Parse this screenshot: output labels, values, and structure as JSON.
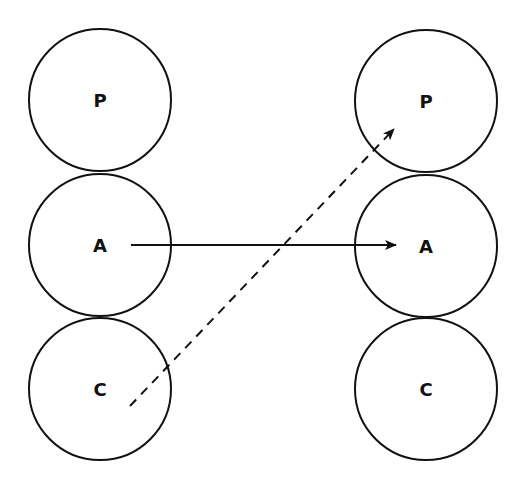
{
  "diagram": {
    "stroke_color": "#111111",
    "background": "#ffffff",
    "left_column": {
      "nodes": [
        {
          "label": "P",
          "cx": 100,
          "cy": 100,
          "r": 71
        },
        {
          "label": "A",
          "cx": 100,
          "cy": 245,
          "r": 71
        },
        {
          "label": "C",
          "cx": 100,
          "cy": 389,
          "r": 71
        }
      ]
    },
    "right_column": {
      "nodes": [
        {
          "label": "P",
          "cx": 426,
          "cy": 101,
          "r": 71
        },
        {
          "label": "A",
          "cx": 426,
          "cy": 246,
          "r": 71
        },
        {
          "label": "C",
          "cx": 426,
          "cy": 389,
          "r": 71
        }
      ]
    },
    "edges": [
      {
        "from": "left.A",
        "to": "right.A",
        "style": "solid",
        "x1": 131,
        "y1": 245,
        "x2": 396,
        "y2": 245
      },
      {
        "from": "left.C",
        "to": "right.P",
        "style": "dashed",
        "x1": 130,
        "y1": 406,
        "x2": 394,
        "y2": 129
      }
    ]
  }
}
